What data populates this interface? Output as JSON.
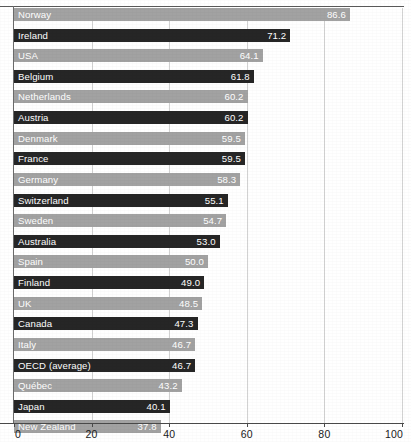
{
  "chart_data": {
    "type": "bar",
    "orientation": "horizontal",
    "title": "",
    "subtitle": "",
    "xlabel": "",
    "ylabel": "",
    "xlim": [
      0,
      100
    ],
    "xticks": [
      0,
      20,
      40,
      60,
      80,
      100
    ],
    "xtick_labels": [
      "0",
      "20",
      "40",
      "60",
      "80",
      "100"
    ],
    "grid": true,
    "grid_axis": "x",
    "legend": false,
    "legend_position": "none",
    "value_labels": true,
    "value_label_position": "inside-end",
    "bar_colors_alternating": [
      "#a2a2a2",
      "#262626"
    ],
    "categories": [
      "Norway",
      "Ireland",
      "USA",
      "Belgium",
      "Netherlands",
      "Austria",
      "Denmark",
      "France",
      "Germany",
      "Switzerland",
      "Sweden",
      "Australia",
      "Spain",
      "Finland",
      "UK",
      "Canada",
      "Italy",
      "OECD (average)",
      "Québec",
      "Japan",
      "New Zealand"
    ],
    "values": [
      86.6,
      71.2,
      64.1,
      61.8,
      60.2,
      60.2,
      59.5,
      59.5,
      58.3,
      55.1,
      54.7,
      53.0,
      50.0,
      49.0,
      48.5,
      47.3,
      46.7,
      46.7,
      43.2,
      40.1,
      37.8
    ],
    "value_labels_text": [
      "86.6",
      "71.2",
      "64.1",
      "61.8",
      "60.2",
      "60.2",
      "59.5",
      "59.5",
      "58.3",
      "55.1",
      "54.7",
      "53.0",
      "50.0",
      "49.0",
      "48.5",
      "47.3",
      "46.7",
      "46.7",
      "43.2",
      "40.1",
      "37.8"
    ]
  },
  "colors": {
    "bar_light": "#a2a2a2",
    "bar_dark": "#262626",
    "gridline": "#d2d2d2",
    "axis": "#4a4a4a",
    "label_text": "#ffffff",
    "tick_text": "#1a1a1a",
    "background": "#ffffff"
  }
}
